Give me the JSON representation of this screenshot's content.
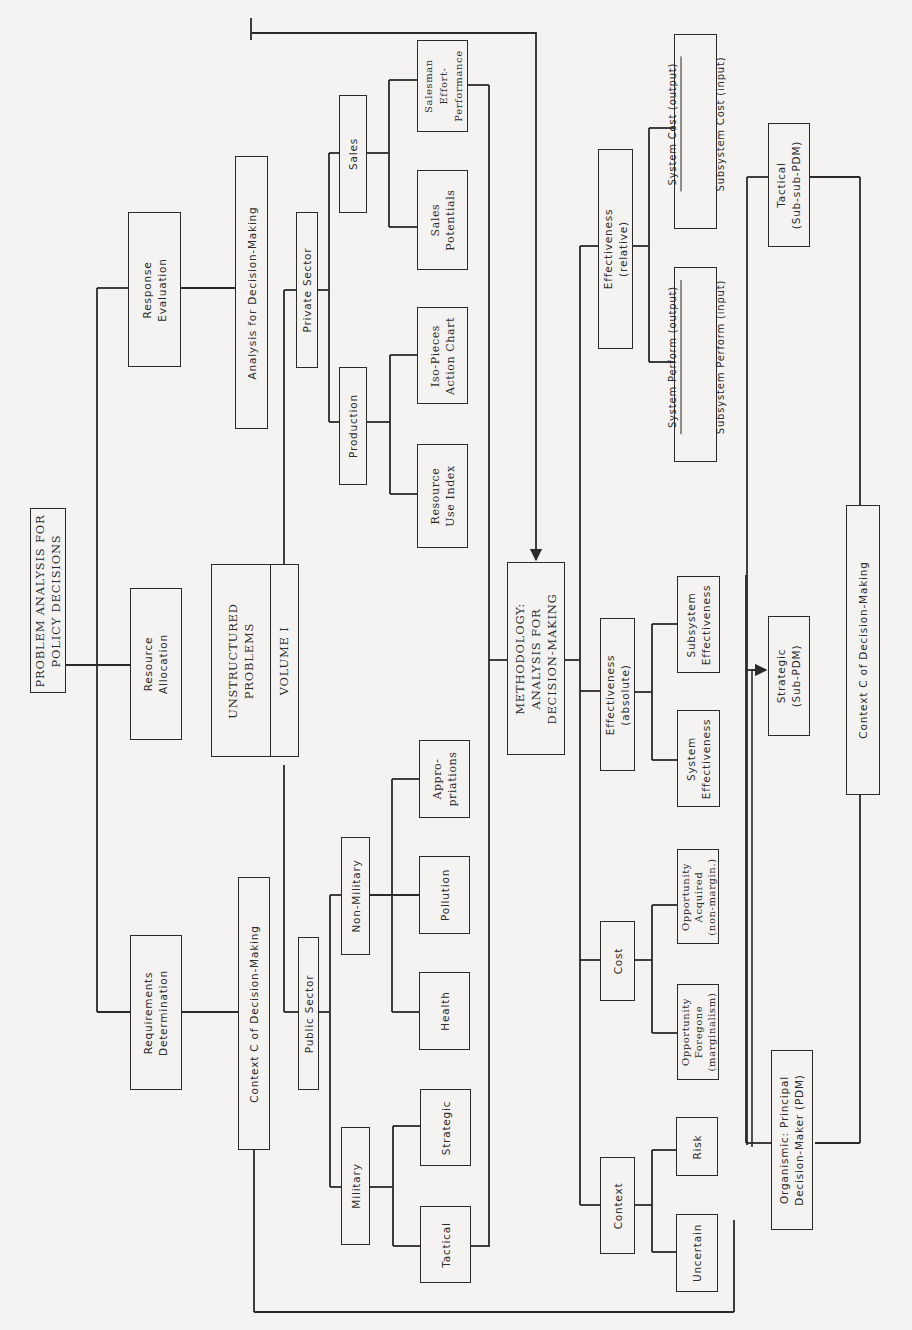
{
  "diagram": {
    "orientation": "rotated-90-ccw",
    "root": {
      "title": "PROBLEM ANALYSIS FOR\nPOLICY DECISIONS",
      "functions": [
        {
          "label": "Requirements\nDetermination"
        },
        {
          "label": "Resource\nAllocation"
        },
        {
          "label": "Response\nEvaluation"
        }
      ]
    },
    "volume": {
      "title": "UNSTRUCTURED\nPROBLEMS",
      "tag": "VOLUME I"
    },
    "context_c_left": {
      "label": "Context C of Decision-Making"
    },
    "analysis_for_dm": {
      "label": "Analysis for Decision-Making"
    },
    "public_sector": {
      "label": "Public Sector",
      "military": {
        "label": "Military",
        "children": [
          {
            "label": "Tactical"
          },
          {
            "label": "Strategic"
          }
        ]
      },
      "non_military": {
        "label": "Non-Military",
        "children": [
          {
            "label": "Health"
          },
          {
            "label": "Pollution"
          },
          {
            "label": "Appro-\npriations"
          }
        ]
      }
    },
    "private_sector": {
      "label": "Private Sector",
      "production": {
        "label": "Production",
        "children": [
          {
            "label": "Resource\nUse Index"
          },
          {
            "label": "Iso-Pieces\nAction Chart"
          }
        ]
      },
      "sales": {
        "label": "Sales",
        "children": [
          {
            "label": "Sales\nPotentials"
          },
          {
            "label": "Salesman\nEffort-\nPerformance"
          }
        ]
      }
    },
    "methodology": {
      "title": "METHODOLOGY:\nANALYSIS FOR\nDECISION-MAKING",
      "branches": [
        {
          "label": "Context",
          "children": [
            {
              "label": "Uncertain"
            },
            {
              "label": "Risk"
            }
          ]
        },
        {
          "label": "Cost",
          "children": [
            {
              "label": "Opportunity\nForegone\n(marginalism)"
            },
            {
              "label": "Opportunity\nAcquired\n(non-margin.)"
            }
          ]
        },
        {
          "label": "Effectiveness\n(absolute)",
          "children": [
            {
              "label": "System\nEffectiveness"
            },
            {
              "label": "Subsystem\nEffectiveness"
            }
          ]
        },
        {
          "label": "Effectiveness\n(relative)",
          "children": [
            {
              "numerator": "System Perform (output)",
              "denominator": "Subsystem Perform (input)"
            },
            {
              "numerator": "System Cost (output)",
              "denominator": "Subsystem Cost (input)"
            }
          ]
        }
      ]
    },
    "decision_makers": {
      "context_c_right": {
        "label": "Context C of Decision-Making"
      },
      "levels": [
        {
          "label": "Organismic: Principal\nDecision-Maker (PDM)"
        },
        {
          "label": "Strategic\n(Sub-PDM)"
        },
        {
          "label": "Tactical\n(Sub-sub-PDM)"
        }
      ]
    }
  },
  "colors": {
    "paper": "#f4f3f1",
    "ink": "#2a2a2a"
  }
}
